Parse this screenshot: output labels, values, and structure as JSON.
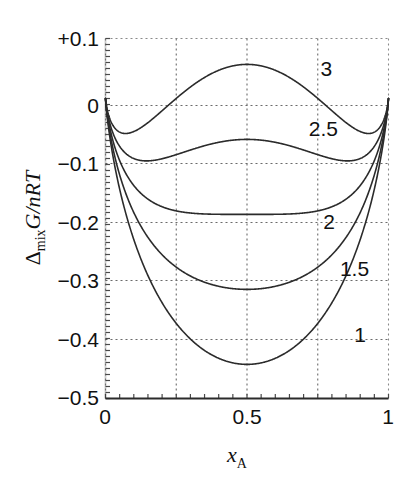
{
  "figure": {
    "background_color": "#ffffff",
    "curve_color": "#2b2b2b",
    "grid_color": "#6b6b6b",
    "axis_color": "#2b2b2b"
  },
  "chart_data": {
    "type": "line",
    "title": "",
    "xlabel": "x_A",
    "ylabel": "Δmix G/nRT",
    "xlim": [
      0,
      1
    ],
    "ylim": [
      -0.5,
      0.1
    ],
    "grid": true,
    "legend_position": "inline-right",
    "xticks": [
      0,
      0.5,
      1
    ],
    "xtick_labels": [
      "0",
      "0.5",
      "1"
    ],
    "yticks": [
      0.1,
      0,
      -0.1,
      -0.2,
      -0.3,
      -0.4,
      -0.5
    ],
    "ytick_labels": [
      "+0.1",
      "0",
      "−0.1",
      "−0.2",
      "−0.3",
      "−0.4",
      "−0.5"
    ],
    "x_gridlines": [
      0.25,
      0.5,
      0.75
    ],
    "y_gridlines": [
      0,
      -0.1,
      -0.2,
      -0.3,
      -0.4
    ],
    "model": "dG/nRT = x*ln(x) + (1-x)*ln(1-x) + xi*x*(1-x)",
    "parameter_name": "xi",
    "x": [
      0,
      0.01,
      0.02,
      0.03,
      0.04,
      0.05,
      0.06,
      0.07,
      0.08,
      0.09,
      0.1,
      0.12,
      0.14,
      0.16,
      0.18,
      0.2,
      0.25,
      0.3,
      0.35,
      0.4,
      0.45,
      0.5,
      0.55,
      0.6,
      0.65,
      0.7,
      0.75,
      0.8,
      0.82,
      0.84,
      0.86,
      0.88,
      0.9,
      0.91,
      0.92,
      0.93,
      0.94,
      0.95,
      0.96,
      0.97,
      0.98,
      0.99,
      1
    ],
    "series": [
      {
        "name": "1",
        "xi": 1,
        "label": "1",
        "label_x": 0.9,
        "label_y": -0.405,
        "min_value": -0.443,
        "min_x": 0.5,
        "values": [
          0,
          -0.0466,
          -0.0786,
          -0.1063,
          -0.1313,
          -0.1546,
          -0.1764,
          -0.1971,
          -0.2169,
          -0.2359,
          -0.2542,
          -0.2889,
          -0.3215,
          -0.3522,
          -0.3813,
          -0.4089,
          -0.4687,
          -0.5211,
          -0.5654,
          -0.601,
          -0.6278,
          -0.6431,
          -0.6278,
          -0.601,
          -0.5654,
          -0.5211,
          -0.4687,
          -0.4089,
          -0.3813,
          -0.3522,
          -0.3215,
          -0.2889,
          -0.2542,
          -0.2359,
          -0.2169,
          -0.1971,
          -0.1764,
          -0.1546,
          -0.1313,
          -0.1063,
          -0.0786,
          -0.0466,
          0
        ]
      },
      {
        "name": "1.5",
        "xi": 1.5,
        "label": "1.5",
        "label_x": 0.88,
        "label_y": -0.296,
        "min_value": -0.318,
        "min_x": 0.5,
        "values": [
          0,
          -0.0318,
          -0.0492,
          -0.0626,
          -0.0737,
          -0.0834,
          -0.0918,
          -0.0994,
          -0.1065,
          -0.113,
          -0.1192,
          -0.1305,
          -0.1409,
          -0.1506,
          -0.1597,
          -0.1689,
          -0.1875,
          -0.2061,
          -0.2243,
          -0.241,
          -0.2562,
          -0.2681,
          -0.2562,
          -0.241,
          -0.2243,
          -0.2061,
          -0.1875,
          -0.1689,
          -0.1597,
          -0.1506,
          -0.1409,
          -0.1305,
          -0.1192,
          -0.113,
          -0.1065,
          -0.0994,
          -0.0918,
          -0.0834,
          -0.0737,
          -0.0626,
          -0.0492,
          -0.0318,
          0
        ]
      },
      {
        "name": "2",
        "xi": 2,
        "label": "2",
        "label_x": 0.79,
        "label_y": -0.218,
        "min_value": -0.193,
        "min_x": 0.5,
        "values": [
          0,
          -0.0268,
          -0.0394,
          -0.0481,
          -0.0545,
          -0.0596,
          -0.0636,
          -0.067,
          -0.0698,
          -0.0723,
          -0.0745,
          -0.0782,
          -0.0813,
          -0.0841,
          -0.0866,
          -0.0889,
          -0.0937,
          -0.0981,
          -0.1023,
          -0.1062,
          -0.1097,
          -0.1125,
          -0.1097,
          -0.1062,
          -0.1023,
          -0.0981,
          -0.0937,
          -0.0889,
          -0.0866,
          -0.0841,
          -0.0813,
          -0.0782,
          -0.0745,
          -0.0723,
          -0.0698,
          -0.067,
          -0.0636,
          -0.0596,
          -0.0545,
          -0.0481,
          -0.0394,
          -0.0268,
          0
        ]
      },
      {
        "name": "2.5",
        "xi": 2.5,
        "label": "2.5",
        "label_x": 0.77,
        "label_y": -0.063,
        "local_max_value": -0.068,
        "local_max_x": 0.5,
        "min_value": -0.101,
        "min_x": 0.17,
        "values": [
          0,
          -0.0219,
          -0.0296,
          -0.0336,
          -0.0353,
          -0.0359,
          -0.0354,
          -0.0346,
          -0.033,
          -0.0315,
          -0.0298,
          -0.0259,
          -0.0217,
          -0.0175,
          -0.0134,
          -0.0089,
          0.0,
          0.01,
          0.0198,
          0.0286,
          0.0357,
          0.0394,
          0.0357,
          0.0286,
          0.0198,
          0.01,
          0.0,
          -0.0089,
          -0.0134,
          -0.0175,
          -0.0217,
          -0.0259,
          -0.0298,
          -0.0315,
          -0.033,
          -0.0346,
          -0.0354,
          -0.0359,
          -0.0353,
          -0.0336,
          -0.0296,
          -0.0219,
          0
        ]
      },
      {
        "name": "3",
        "xi": 3,
        "label": "3",
        "label_x": 0.78,
        "label_y": 0.038,
        "max_value": 0.057,
        "max_x": 0.5,
        "min_value": -0.059,
        "min_x": 0.077,
        "values": [
          0,
          -0.0169,
          -0.0198,
          -0.0191,
          -0.0161,
          -0.0121,
          -0.0072,
          -0.0022,
          0.0038,
          0.0092,
          0.0155,
          0.0264,
          0.0379,
          0.049,
          0.0599,
          0.0711,
          0.0937,
          0.1161,
          0.1372,
          0.157,
          0.1747,
          0.1819,
          0.1747,
          0.157,
          0.1372,
          0.1161,
          0.0937,
          0.0711,
          0.0599,
          0.049,
          0.0379,
          0.0264,
          0.0155,
          0.0092,
          0.0038,
          -0.0022,
          -0.0072,
          -0.0121,
          -0.0161,
          -0.0191,
          -0.0198,
          -0.0169,
          0
        ]
      }
    ],
    "axis_title_y_parts": {
      "delta": "Δ",
      "delta_sub": "mix",
      "main": "G/nRT"
    },
    "axis_title_x_parts": {
      "main": "x",
      "sub": "A"
    }
  }
}
